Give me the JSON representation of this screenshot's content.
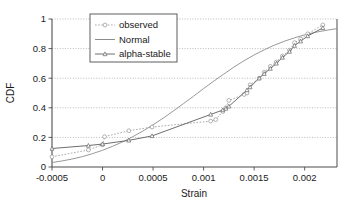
{
  "chart_data": {
    "type": "line",
    "title": "",
    "xlabel": "Strain",
    "ylabel": "CDF",
    "xlim": [
      -0.0005,
      0.00232
    ],
    "ylim": [
      0,
      1
    ],
    "xticks": [
      -0.0005,
      0,
      0.0005,
      0.001,
      0.0015,
      0.002
    ],
    "xtick_labels": [
      "-0.0005",
      "0",
      "0.0005",
      "0.001",
      "0.0015",
      "0.002"
    ],
    "yticks": [
      0,
      0.2,
      0.4,
      0.6,
      0.8,
      1
    ],
    "ytick_labels": [
      "0",
      "0.2",
      "0.4",
      "0.6",
      "0.8",
      "1"
    ],
    "grid": "horizontal-dotted",
    "legend_position": "upper-left-inside",
    "series": [
      {
        "name": "observed",
        "style": "dotted",
        "marker": "open-circle",
        "color": "#9a9a9a",
        "x": [
          -0.0005,
          -0.00014,
          0.0,
          2e-05,
          0.00026,
          0.00049,
          0.00107,
          0.00112,
          0.00119,
          0.00122,
          0.00125,
          0.0014,
          0.00143,
          0.00146,
          0.00155,
          0.0016,
          0.00166,
          0.00172,
          0.00178,
          0.00185,
          0.0019,
          0.00196,
          0.00203,
          0.00218
        ],
        "y": [
          0.069,
          0.115,
          0.15,
          0.205,
          0.245,
          0.27,
          0.31,
          0.32,
          0.375,
          0.4,
          0.45,
          0.49,
          0.5,
          0.555,
          0.6,
          0.64,
          0.68,
          0.71,
          0.75,
          0.79,
          0.84,
          0.865,
          0.9,
          0.96
        ]
      },
      {
        "name": "Normal",
        "style": "solid",
        "marker": "none",
        "color": "#8c8c8c",
        "x": [
          -0.0005,
          -0.0004,
          -0.0003,
          -0.0002,
          -0.0001,
          0.0,
          0.0001,
          0.0002,
          0.0003,
          0.0004,
          0.0005,
          0.0006,
          0.0007,
          0.0008,
          0.0009,
          0.001,
          0.0011,
          0.0012,
          0.0013,
          0.0014,
          0.0015,
          0.0016,
          0.0017,
          0.0018,
          0.0019,
          0.002,
          0.0021,
          0.0022,
          0.00232
        ],
        "y": [
          0.03,
          0.041,
          0.054,
          0.07,
          0.09,
          0.113,
          0.14,
          0.17,
          0.205,
          0.243,
          0.285,
          0.33,
          0.378,
          0.428,
          0.478,
          0.53,
          0.58,
          0.628,
          0.675,
          0.718,
          0.757,
          0.792,
          0.823,
          0.85,
          0.873,
          0.893,
          0.909,
          0.922,
          0.935
        ]
      },
      {
        "name": "alpha-stable",
        "style": "solid",
        "marker": "triangle",
        "color": "#6e6e6e",
        "x": [
          -0.0005,
          -0.00014,
          0.0,
          0.00026,
          0.00049,
          0.00107,
          0.00119,
          0.00122,
          0.00125,
          0.00143,
          0.00146,
          0.00155,
          0.0016,
          0.00166,
          0.00172,
          0.00178,
          0.00185,
          0.0019,
          0.00196,
          0.00203,
          0.00218
        ],
        "y": [
          0.125,
          0.145,
          0.155,
          0.18,
          0.21,
          0.355,
          0.385,
          0.395,
          0.41,
          0.52,
          0.54,
          0.6,
          0.63,
          0.665,
          0.7,
          0.74,
          0.78,
          0.82,
          0.85,
          0.885,
          0.94
        ]
      }
    ],
    "legend_entries": [
      {
        "label": "observed",
        "style": "dotted",
        "marker": "open-circle"
      },
      {
        "label": "Normal",
        "style": "solid",
        "marker": "none"
      },
      {
        "label": "alpha-stable",
        "style": "solid",
        "marker": "triangle"
      }
    ]
  },
  "colors": {
    "axis": "#4d4d4d",
    "grid": "#a8a8a8",
    "observed": "#9a9a9a",
    "normal": "#8c8c8c",
    "alpha_stable": "#6e6e6e",
    "text": "#1a1a1a",
    "background": "#ffffff"
  }
}
